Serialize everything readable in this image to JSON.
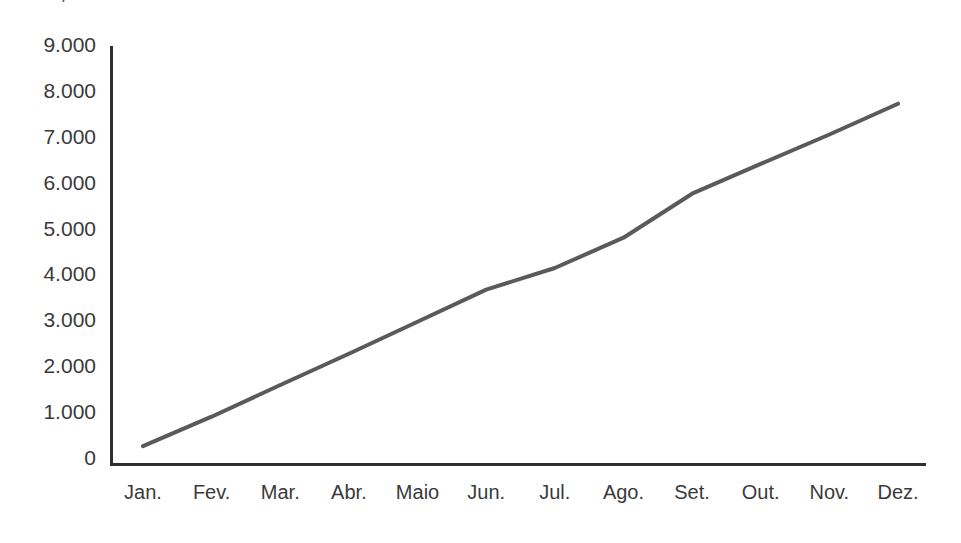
{
  "figure": {
    "background_color": "#ffffff",
    "partial_title_remnant": "Comparativo",
    "axis_color": "#2f2f2f",
    "tick_text_color": "#3a3a3a"
  },
  "chart_data": {
    "type": "line",
    "title": "",
    "xlabel": "",
    "ylabel": "",
    "categories": [
      "Jan.",
      "Fev.",
      "Mar.",
      "Abr.",
      "Maio",
      "Jun.",
      "Jul.",
      "Ago.",
      "Set.",
      "Out.",
      "Nov.",
      "Dez."
    ],
    "values": [
      260,
      900,
      1590,
      2270,
      2970,
      3670,
      4140,
      4800,
      5760,
      6410,
      7050,
      7720
    ],
    "series": [
      {
        "name": "",
        "color": "#5a5a5a",
        "line_width": 4,
        "values": [
          260,
          900,
          1590,
          2270,
          2970,
          3670,
          4140,
          4800,
          5760,
          6410,
          7050,
          7720
        ]
      }
    ],
    "ylim": [
      0,
      9000
    ],
    "yticks": [
      0,
      1000,
      2000,
      3000,
      4000,
      5000,
      6000,
      7000,
      8000,
      9000
    ],
    "ytick_labels": [
      "0",
      "1.000",
      "2.000",
      "3.000",
      "4.000",
      "5.000",
      "6.000",
      "7.000",
      "8.000",
      "9.000"
    ],
    "xtick_labels": [
      "Jan.",
      "Fev.",
      "Mar.",
      "Abr.",
      "Maio",
      "Jun.",
      "Jul.",
      "Ago.",
      "Set.",
      "Out.",
      "Nov.",
      "Dez."
    ],
    "grid": false,
    "legend": null,
    "legend_position": "none",
    "markers": false,
    "thousands_separator": "."
  }
}
